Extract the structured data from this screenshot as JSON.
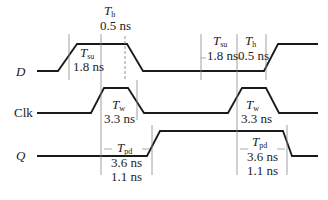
{
  "signals": [
    {
      "id": "D",
      "label": "D",
      "italic": true
    },
    {
      "id": "Clk",
      "label": "Clk",
      "italic": false
    },
    {
      "id": "Q",
      "label": "Q",
      "italic": true
    }
  ],
  "annotations": {
    "th_left": {
      "symbol": "T",
      "sub": "h",
      "value": "0.5 ns"
    },
    "tsu_left": {
      "symbol": "T",
      "sub": "su",
      "value": "1.8 ns"
    },
    "tsu_right": {
      "symbol": "T",
      "sub": "su",
      "value": "1.8 ns"
    },
    "th_right": {
      "symbol": "T",
      "sub": "h",
      "value": "0.5 ns"
    },
    "tw_left": {
      "symbol": "T",
      "sub": "w",
      "value": "3.3 ns"
    },
    "tw_right": {
      "symbol": "T",
      "sub": "w",
      "value": "3.3 ns"
    },
    "tpd_left": {
      "symbol": "T",
      "sub": "pd",
      "value": "3.6 ns",
      "value2": "1.1 ns"
    },
    "tpd_right": {
      "symbol": "T",
      "sub": "pd",
      "value": "3.6 ns",
      "value2": "1.1 ns"
    }
  },
  "colors": {
    "wave": "#1a1a1a",
    "guide": "#888888",
    "text": "#222222"
  }
}
